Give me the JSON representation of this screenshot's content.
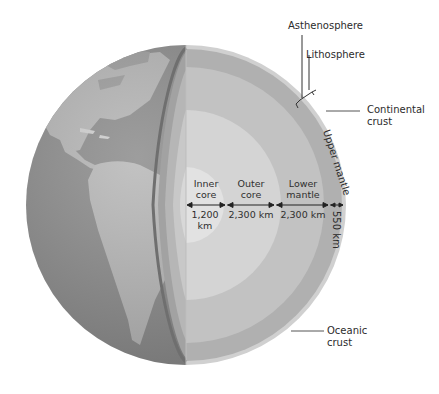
{
  "colors": {
    "background": "#ffffff",
    "globe_ocean": "#8a8a8a",
    "globe_land": "#b8b8b8",
    "crust": "#c9c9c9",
    "upper_mantle": "#a9a9a9",
    "lower_mantle": "#bdbdbd",
    "outer_core": "#cfcfcf",
    "inner_core": "#dedede",
    "text": "#2b2b2b",
    "leader_line": "#555555"
  },
  "callouts": {
    "asthenosphere": "Asthenosphere",
    "lithosphere": "Lithosphere",
    "continental_crust_line1": "Continental",
    "continental_crust_line2": "crust",
    "oceanic_crust_line1": "Oceanic",
    "oceanic_crust_line2": "crust"
  },
  "layers": [
    {
      "name_line1": "Inner",
      "name_line2": "core",
      "thickness_line1": "1,200",
      "thickness_line2": "km"
    },
    {
      "name_line1": "Outer",
      "name_line2": "core",
      "thickness_line1": "2,300 km",
      "thickness_line2": ""
    },
    {
      "name_line1": "Lower",
      "name_line2": "mantle",
      "thickness_line1": "2,300 km",
      "thickness_line2": ""
    },
    {
      "name_line1": "Upper mantle",
      "name_line2": "",
      "thickness_line1": "550 km",
      "thickness_line2": ""
    }
  ]
}
